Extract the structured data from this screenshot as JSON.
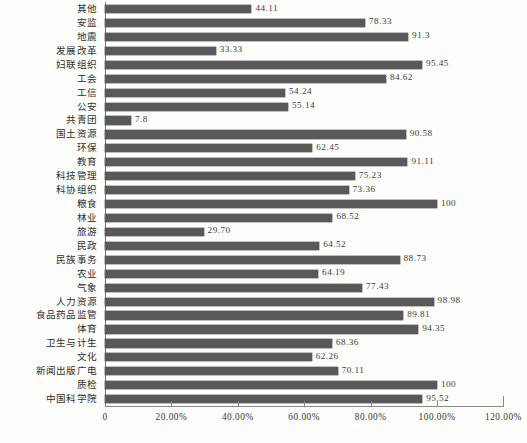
{
  "chart_data": {
    "type": "bar",
    "orientation": "horizontal",
    "title": "",
    "xlabel": "",
    "ylabel": "",
    "xlim": [
      0,
      120
    ],
    "grid": false,
    "legend": false,
    "bar_color": "#595959",
    "axis_color": "#8a8a86",
    "value_label_position": "outside-end",
    "x_tick_labels": [
      "0",
      "20.00%",
      "40.00%",
      "60.00%",
      "80.00%",
      "100.00%",
      "120.00%"
    ],
    "x_tick_values": [
      0,
      20,
      40,
      60,
      80,
      100,
      120
    ],
    "categories": [
      "其他",
      "安监",
      "地震",
      "发展改革",
      "妇联组织",
      "工会",
      "工信",
      "公安",
      "共青团",
      "国土资源",
      "环保",
      "教育",
      "科技管理",
      "科协组织",
      "粮食",
      "林业",
      "旅游",
      "民政",
      "民族事务",
      "农业",
      "气象",
      "人力资源",
      "食品药品监管",
      "体育",
      "卫生与计生",
      "文化",
      "新闻出版广电",
      "质检",
      "中国科学院"
    ],
    "values": [
      44.11,
      78.33,
      91.3,
      33.33,
      95.45,
      84.62,
      54.24,
      55.14,
      7.8,
      90.58,
      62.45,
      91.11,
      75.23,
      73.36,
      100,
      68.52,
      29.7,
      64.52,
      88.73,
      64.19,
      77.43,
      98.98,
      89.81,
      94.35,
      68.36,
      62.26,
      70.11,
      100,
      95.52
    ],
    "value_labels": [
      "44.11",
      "78.33",
      "91.3",
      "33.33",
      "95.45",
      "84.62",
      "54.24",
      "55.14",
      "7.8",
      "90.58",
      "62.45",
      "91.11",
      "75.23",
      "73.36",
      "100",
      "68.52",
      "29.70",
      "64.52",
      "88.73",
      "64.19",
      "77.43",
      "98.98",
      "89.81",
      "94.35",
      "68.36",
      "62.26",
      "70.11",
      "100",
      "95.52"
    ]
  },
  "caption": ""
}
